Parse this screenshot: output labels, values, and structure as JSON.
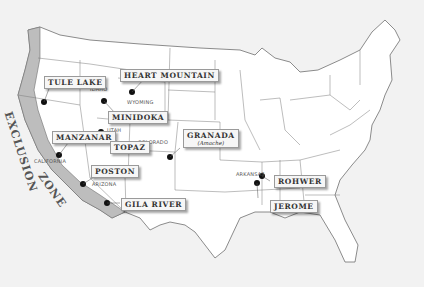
{
  "map": {
    "title": "Japanese American Incarceration Camps",
    "colors": {
      "background": "#f2f2f2",
      "land": "#ffffff",
      "borders": "#777777",
      "exclusion_zone": "#bdbdbd",
      "camp_marker": "#111111"
    },
    "exclusion_zone": {
      "line1": "EXCLUSION",
      "line2": "ZONE"
    },
    "camps": [
      {
        "name": "Tule Lake",
        "x": 44,
        "y": 102
      },
      {
        "name": "Heart Mountain",
        "x": 132,
        "y": 92
      },
      {
        "name": "Minidoka",
        "x": 104,
        "y": 101
      },
      {
        "name": "Manzanar",
        "x": 101,
        "y": 132
      },
      {
        "name": "Topaz",
        "x": 118,
        "y": 158
      },
      {
        "name": "Granada",
        "subtitle": "(Amache)",
        "x": 170,
        "y": 157
      },
      {
        "name": "Poston",
        "x": 83,
        "y": 183
      },
      {
        "name": "Gila River",
        "x": 107,
        "y": 203
      },
      {
        "name": "Rohwer",
        "x": 262,
        "y": 176
      },
      {
        "name": "Jerome",
        "x": 257,
        "y": 183
      }
    ],
    "states": [
      {
        "name": "IDAHO",
        "x": 90,
        "y": 88
      },
      {
        "name": "WYOMING",
        "x": 128,
        "y": 101
      },
      {
        "name": "UTAH",
        "x": 108,
        "y": 129
      },
      {
        "name": "COLORADO",
        "x": 138,
        "y": 140
      },
      {
        "name": "CALIFORNIA",
        "x": 34,
        "y": 160
      },
      {
        "name": "ARIZONA",
        "x": 92,
        "y": 183
      },
      {
        "name": "ARKANSAS",
        "x": 237,
        "y": 173
      }
    ]
  }
}
